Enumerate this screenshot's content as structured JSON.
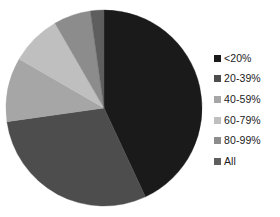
{
  "chart_data": {
    "type": "pie",
    "title": "",
    "legend_position": "right",
    "categories": [
      "<20%",
      "20-39%",
      "40-59%",
      "60-79%",
      "80-99%",
      "All"
    ],
    "values": [
      43.1,
      29.7,
      10.6,
      8.3,
      6.1,
      2.2
    ],
    "units": "percent of total",
    "start_angle_deg": 0,
    "direction": "clockwise",
    "slices": [
      {
        "label": "<20%",
        "value": 43.1,
        "angle_deg": 155,
        "color": "#1a1a1a"
      },
      {
        "label": "20-39%",
        "value": 29.7,
        "angle_deg": 107,
        "color": "#4d4d4d"
      },
      {
        "label": "40-59%",
        "value": 10.6,
        "angle_deg": 38,
        "color": "#a6a6a6"
      },
      {
        "label": "60-79%",
        "value": 8.3,
        "angle_deg": 30,
        "color": "#bfbfbf"
      },
      {
        "label": "80-99%",
        "value": 6.1,
        "angle_deg": 22,
        "color": "#8c8c8c"
      },
      {
        "label": "All",
        "value": 2.2,
        "angle_deg": 8,
        "color": "#5e5e5e"
      }
    ],
    "geometry": {
      "center_x": 104,
      "center_y": 108,
      "radius": 98
    },
    "xlabel": "",
    "ylabel": ""
  },
  "legend": {
    "items": [
      {
        "label": "<20%",
        "color": "#1a1a1a"
      },
      {
        "label": "20-39%",
        "color": "#4d4d4d"
      },
      {
        "label": "40-59%",
        "color": "#a6a6a6"
      },
      {
        "label": "60-79%",
        "color": "#bfbfbf"
      },
      {
        "label": "80-99%",
        "color": "#8c8c8c"
      },
      {
        "label": "All",
        "color": "#5e5e5e"
      }
    ]
  }
}
